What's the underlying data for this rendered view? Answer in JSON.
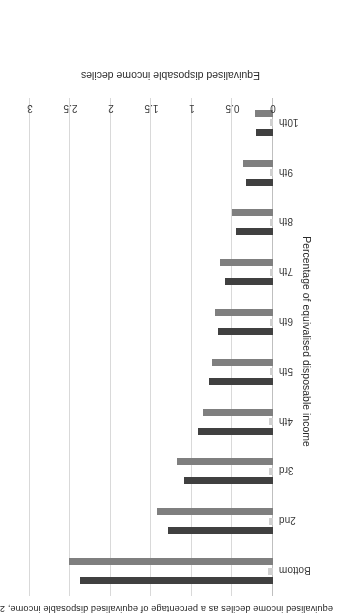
{
  "chart_data": {
    "type": "bar",
    "orientation": "horizontal",
    "title": "equivalised income deciles as a percentage of equivalised disposable income, 2019-20",
    "xlabel": "Percentage of equivalised disposable income",
    "ylabel": "Equivalised disposable income deciles",
    "xlim": [
      0,
      3
    ],
    "xticks": [
      "0",
      "0.5",
      "1",
      "1.5",
      "2",
      "2.5",
      "3"
    ],
    "xtick_values": [
      0,
      0.5,
      1,
      1.5,
      2,
      2.5,
      3
    ],
    "grid": true,
    "legend": "none",
    "categories": [
      "Bottom",
      "2nd",
      "3rd",
      "4th",
      "5th",
      "6th",
      "7th",
      "8th",
      "9th",
      "10th"
    ],
    "series": [
      {
        "name": "series-dark",
        "color": "#404040",
        "values": [
          2.38,
          1.3,
          1.1,
          0.92,
          0.79,
          0.68,
          0.59,
          0.46,
          0.33,
          0.21
        ]
      },
      {
        "name": "series-light",
        "color": "#d0d0d0",
        "values": [
          0.06,
          0.05,
          0.05,
          0.05,
          0.04,
          0.04,
          0.04,
          0.04,
          0.04,
          0.04
        ]
      },
      {
        "name": "series-medium",
        "color": "#7f7f7f",
        "values": [
          2.52,
          1.43,
          1.18,
          0.87,
          0.75,
          0.72,
          0.65,
          0.5,
          0.37,
          0.22
        ]
      }
    ]
  },
  "colors": {
    "dark": "#404040",
    "light": "#d0d0d0",
    "medium": "#7f7f7f",
    "grid": "#d9d9d9",
    "axis": "#bfbfbf",
    "text": "#2b2b2b"
  }
}
